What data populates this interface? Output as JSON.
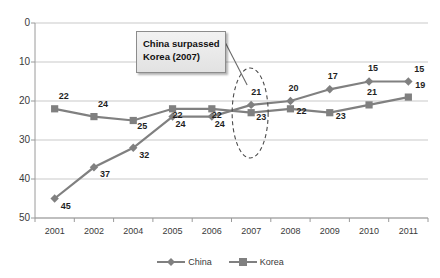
{
  "chart_data": {
    "type": "line",
    "title": "",
    "xlabel": "",
    "ylabel": "",
    "categories": [
      "2001",
      "2002",
      "2004",
      "2005",
      "2006",
      "2007",
      "2008",
      "2009",
      "2010",
      "2011"
    ],
    "ylim": [
      0,
      50
    ],
    "y_inverted": true,
    "y_ticks": [
      "0",
      "10",
      "20",
      "30",
      "40",
      "50"
    ],
    "grid": true,
    "legend_position": "bottom",
    "series": [
      {
        "name": "China",
        "marker": "diamond",
        "color": "#808080",
        "values": [
          45,
          37,
          32,
          24,
          24,
          21,
          20,
          17,
          15,
          15
        ]
      },
      {
        "name": "Korea",
        "marker": "square",
        "color": "#808080",
        "values": [
          22,
          24,
          25,
          22,
          22,
          23,
          22,
          23,
          21,
          19
        ]
      }
    ],
    "annotations": [
      {
        "name": "china-surpassed-korea-callout",
        "line1": "China surpassed",
        "line2": "Korea (2007)",
        "highlight_shape": "dashed-ellipse",
        "highlight_category": "2007"
      }
    ]
  },
  "colors": {
    "series": "#808080",
    "gridline": "#c9c9c9",
    "axis": "#9a9a9a",
    "text": "#3a3a3a",
    "label_text": "#1f1f1f"
  }
}
